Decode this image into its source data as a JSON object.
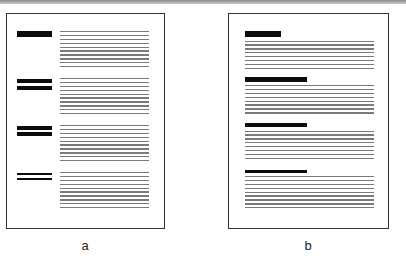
{
  "figure": {
    "panels": [
      {
        "id": "a",
        "label": "a",
        "layout": "headings-left-of-text",
        "blocks": [
          {
            "heading_bars": [
              6
            ],
            "heading_width": 35,
            "text_lines": 10
          },
          {
            "heading_bars": [
              4,
              4
            ],
            "heading_width": 35,
            "text_lines": 10
          },
          {
            "heading_bars": [
              3.5,
              3.5
            ],
            "heading_width": 35,
            "text_lines": 10
          },
          {
            "heading_bars": [
              2,
              2
            ],
            "heading_width": 35,
            "text_lines": 10
          }
        ]
      },
      {
        "id": "b",
        "label": "b",
        "layout": "headings-above-text",
        "blocks": [
          {
            "heading_bars": [
              6
            ],
            "heading_width": 36,
            "text_lines": 8
          },
          {
            "heading_bars": [
              4.5
            ],
            "heading_width": 62,
            "text_lines": 8
          },
          {
            "heading_bars": [
              4
            ],
            "heading_width": 62,
            "text_lines": 8
          },
          {
            "heading_bars": [
              2.5
            ],
            "heading_width": 62,
            "text_lines": 9
          }
        ]
      }
    ]
  },
  "colors": {
    "heading": "#0c0c0c",
    "text_line": "#7a7a7a",
    "frame": "#333333"
  }
}
